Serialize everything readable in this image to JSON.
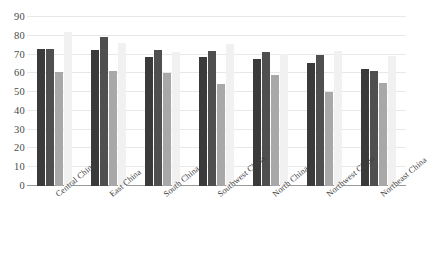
{
  "chart_data": {
    "type": "bar",
    "title": "",
    "subtitle": "",
    "xlabel": "",
    "ylabel": "",
    "ylim": [
      0,
      90
    ],
    "yticks": [
      0,
      10,
      20,
      30,
      40,
      50,
      60,
      70,
      80,
      90
    ],
    "ytick_labels": [
      "0",
      "10",
      "20",
      "30",
      "40",
      "50",
      "60",
      "70",
      "80",
      "90"
    ],
    "grid": true,
    "legend": "none",
    "orientation": "vertical",
    "grouping": "clustered",
    "categories": [
      "Central China",
      "East China",
      "South China",
      "Southwest China",
      "North China",
      "Northwest China",
      "Northeast China"
    ],
    "series": [
      {
        "name": "Series 1",
        "color": "#3a3a3a",
        "values": [
          73.0,
          72.5,
          68.5,
          68.5,
          67.5,
          65.5,
          62.5
        ]
      },
      {
        "name": "Series 2",
        "color": "#4f4f4f",
        "values": [
          73.0,
          79.5,
          72.5,
          72.0,
          71.5,
          70.0,
          61.5
        ]
      },
      {
        "name": "Series 3",
        "color": "#a8a8a8",
        "values": [
          60.5,
          61.0,
          60.0,
          54.5,
          59.0,
          50.0,
          55.0
        ]
      },
      {
        "name": "Series 4",
        "color": "#f1f1f1",
        "values": [
          82.0,
          76.0,
          71.5,
          75.5,
          70.5,
          72.0,
          69.5
        ]
      }
    ]
  },
  "axes": {
    "y_axis_name": "value-axis",
    "x_axis_name": "category-axis"
  }
}
